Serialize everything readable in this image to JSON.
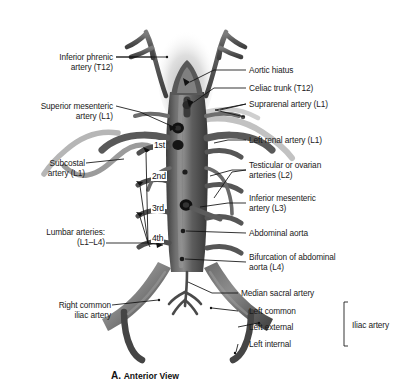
{
  "figure": {
    "caption_letter": "A.",
    "caption_text": "Anterior View",
    "view": "Anterior View"
  },
  "labels_left": [
    {
      "id": "inferior-phrenic-artery",
      "line1": "Inferior phrenic",
      "line2": "artery (T12)"
    },
    {
      "id": "superior-mesenteric-artery",
      "line1": "Superior mesenteric",
      "line2": "artery (L1)"
    },
    {
      "id": "subcostal-artery",
      "line1": "Subcostal",
      "line2": "artery (L1)"
    },
    {
      "id": "lumbar-arteries",
      "line1": "Lumbar arteries:",
      "line2": "(L1–L4)"
    },
    {
      "id": "right-common-iliac-artery",
      "line1": "Right common",
      "line2": "iliac artery"
    }
  ],
  "labels_right": [
    {
      "id": "aortic-hiatus",
      "line1": "Aortic hiatus",
      "line2": ""
    },
    {
      "id": "celiac-trunk",
      "line1": "Celiac trunk (T12)",
      "line2": ""
    },
    {
      "id": "suprarenal-artery",
      "line1": "Suprarenal artery (L1)",
      "line2": ""
    },
    {
      "id": "left-renal-artery",
      "line1": "Left renal artery (L1)",
      "line2": ""
    },
    {
      "id": "testicular-ovarian-arteries",
      "line1": "Testicular or ovarian",
      "line2": "arteries (L2)"
    },
    {
      "id": "inferior-mesenteric-artery",
      "line1": "Inferior mesenteric",
      "line2": "artery (L3)"
    },
    {
      "id": "abdominal-aorta",
      "line1": "Abdominal aorta",
      "line2": ""
    },
    {
      "id": "bifurcation-abdominal-aorta",
      "line1": "Bifurcation of abdominal",
      "line2": "aorta (L4)"
    },
    {
      "id": "median-sacral-artery",
      "line1": "Median sacral artery",
      "line2": ""
    }
  ],
  "iliac_group": {
    "items": [
      {
        "id": "left-common-iliac",
        "label": "Left common"
      },
      {
        "id": "left-external-iliac",
        "label": "Left external"
      },
      {
        "id": "left-internal-iliac",
        "label": "Left internal"
      }
    ],
    "bracket_label": "Iliac artery"
  },
  "lumbar_ordinals": [
    {
      "id": "lumbar-1st",
      "label": "1st"
    },
    {
      "id": "lumbar-2nd",
      "label": "2nd"
    },
    {
      "id": "lumbar-3rd",
      "label": "3rd"
    },
    {
      "id": "lumbar-4th",
      "label": "4th"
    }
  ],
  "colors": {
    "background": "#ffffff",
    "vessel_dark": "#4a4a4a",
    "vessel_mid": "#636363",
    "vessel_light": "#8f8f8f",
    "vessel_pale": "#b9b9b9",
    "ostium": "#141414",
    "leader": "#111111",
    "text": "#1a1a1a",
    "hiatus_shadow": "#c9c9c9"
  }
}
